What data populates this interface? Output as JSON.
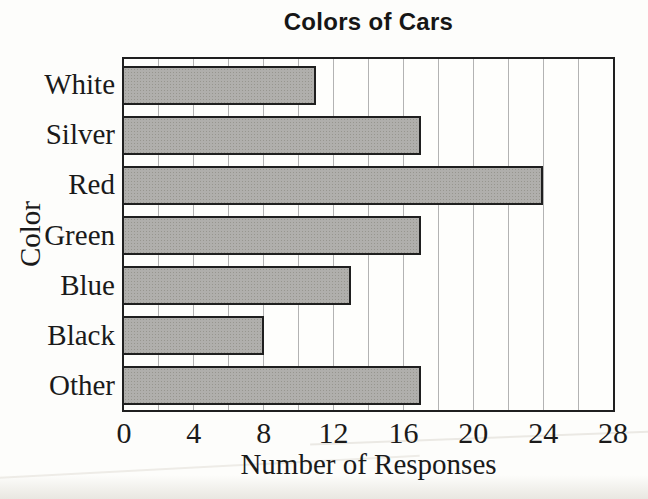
{
  "chart_data": {
    "type": "bar",
    "orientation": "horizontal",
    "title": "Colors of Cars",
    "xlabel": "Number of Responses",
    "ylabel": "Color",
    "categories": [
      "White",
      "Silver",
      "Red",
      "Green",
      "Blue",
      "Black",
      "Other"
    ],
    "values": [
      11,
      17,
      24,
      17,
      13,
      8,
      17
    ],
    "xlim": [
      0,
      28
    ],
    "x_ticks": [
      0,
      4,
      8,
      12,
      16,
      20,
      24,
      28
    ],
    "gridline_step": 2,
    "grid": "vertical-minor-gridlines",
    "legend": "none",
    "bar_color": "#b0afac",
    "bar_border_color": "#1f1f1f",
    "gridline_color": "#b3b3b3",
    "frame_color": "#1f1f1f",
    "background_color": "#fdfdfb"
  }
}
